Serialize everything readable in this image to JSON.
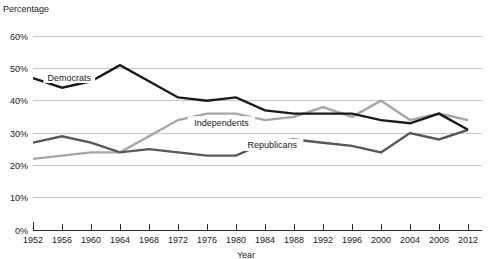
{
  "chart_data": {
    "type": "line",
    "title": "",
    "xlabel": "Year",
    "ylabel": "Percentage",
    "ylim": [
      0,
      60
    ],
    "xlim": [
      1952,
      2012
    ],
    "grid": true,
    "legend_position": "inline-labels",
    "y_ticks": [
      "0%",
      "10%",
      "20%",
      "30%",
      "40%",
      "50%",
      "60%"
    ],
    "y_tick_values": [
      0,
      10,
      20,
      30,
      40,
      50,
      60
    ],
    "x_ticks": [
      "1952",
      "1956",
      "1960",
      "1964",
      "1968",
      "1972",
      "1976",
      "1980",
      "1984",
      "1988",
      "1992",
      "1996",
      "2000",
      "2004",
      "2008",
      "2012"
    ],
    "x": [
      1952,
      1956,
      1960,
      1964,
      1968,
      1972,
      1976,
      1980,
      1984,
      1988,
      1992,
      1996,
      2000,
      2004,
      2008,
      2012
    ],
    "series": [
      {
        "name": "Democrats",
        "color": "#1a1a1a",
        "label_x": 1957,
        "label_y": 47,
        "values": [
          47,
          44,
          46,
          51,
          46,
          41,
          40,
          41,
          37,
          36,
          36,
          36,
          34,
          33,
          36,
          31
        ]
      },
      {
        "name": "Republicans",
        "color": "#595959",
        "label_x": 1985,
        "label_y": 26,
        "values": [
          27,
          29,
          27,
          24,
          25,
          24,
          23,
          23,
          27,
          28,
          27,
          26,
          24,
          30,
          28,
          31
        ]
      },
      {
        "name": "Independents",
        "color": "#a6a6a6",
        "label_x": 1978,
        "label_y": 33,
        "values": [
          22,
          23,
          24,
          24,
          29,
          34,
          36,
          36,
          34,
          35,
          38,
          35,
          40,
          34,
          36,
          34
        ]
      }
    ]
  },
  "labels": {
    "y_axis_title": "Percentage",
    "x_axis_title": "Year",
    "democrats": "Democrats",
    "republicans": "Republicans",
    "independents": "Independents"
  }
}
